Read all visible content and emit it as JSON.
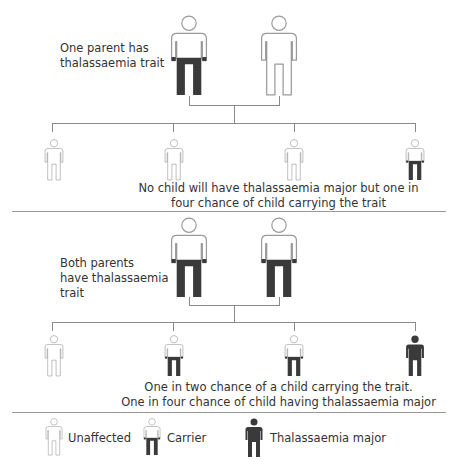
{
  "colors": {
    "outline": "#9a9a9a",
    "filled": "#3a3a3a",
    "line": "#8a8a8a",
    "background": "#ffffff"
  },
  "section1": {
    "label": "One parent has thalassaemia trait",
    "label_lines": [
      "One parent has",
      "thalassaemia trait"
    ],
    "parents": [
      {
        "type": "carrier"
      },
      {
        "type": "unaffected"
      }
    ],
    "children": [
      {
        "type": "unaffected"
      },
      {
        "type": "unaffected"
      },
      {
        "type": "unaffected"
      },
      {
        "type": "carrier"
      }
    ],
    "caption_lines": [
      "No child will have thalassaemia major but one in",
      "four chance of child carrying the trait"
    ]
  },
  "section2": {
    "label": "Both parents have thalassaemia trait",
    "label_lines": [
      "Both parents",
      "have thalassaemia",
      "trait"
    ],
    "parents": [
      {
        "type": "carrier"
      },
      {
        "type": "carrier"
      }
    ],
    "children": [
      {
        "type": "unaffected"
      },
      {
        "type": "carrier"
      },
      {
        "type": "carrier"
      },
      {
        "type": "major"
      }
    ],
    "caption_lines": [
      "One in two chance of a child carrying the trait.",
      "One in four chance of child having thalassaemia major"
    ]
  },
  "legend": {
    "items": [
      {
        "type": "unaffected",
        "label": "Unaffected",
        "icon": "person-outline-icon"
      },
      {
        "type": "carrier",
        "label": "Carrier",
        "icon": "person-carrier-icon"
      },
      {
        "type": "major",
        "label": "Thalassaemia major",
        "icon": "person-filled-icon"
      }
    ]
  }
}
